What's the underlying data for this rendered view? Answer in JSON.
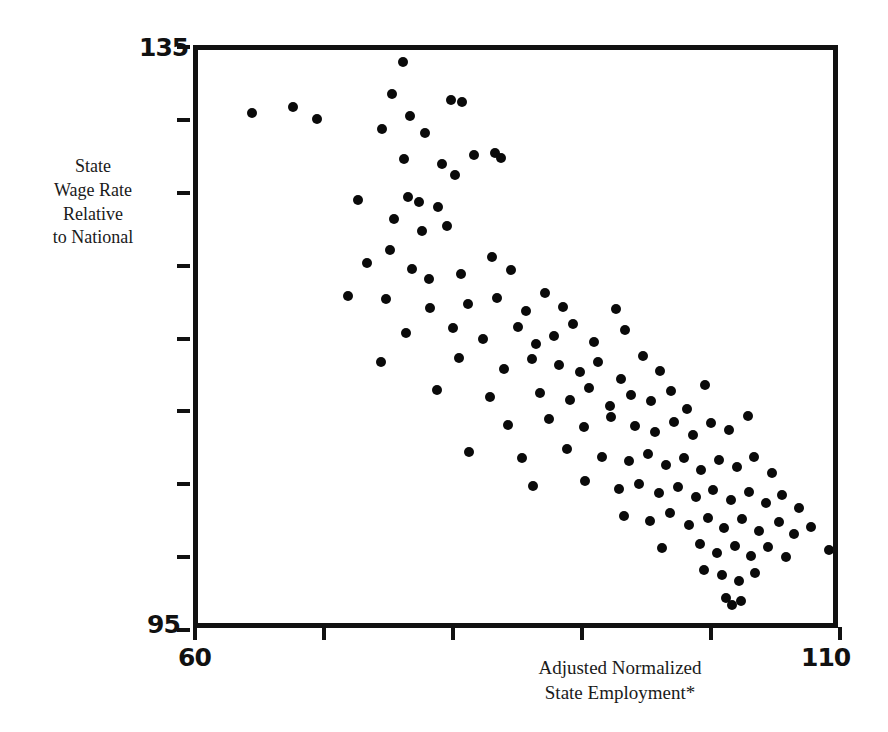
{
  "chart_data": {
    "type": "scatter",
    "title": "",
    "xlabel": "Adjusted Normalized State Employment*",
    "ylabel": "State Wage Rate Relative to National",
    "xlim": [
      60,
      110
    ],
    "ylim": [
      95,
      135
    ],
    "grid": false,
    "legend": null,
    "x_tick_labels": [
      "60",
      "110"
    ],
    "y_tick_labels": [
      "135",
      "95"
    ],
    "x_ticks_count": 6,
    "y_ticks_count": 9,
    "marker": "filled-circle",
    "marker_color": "#0a0a0a",
    "points": [
      [
        64.2,
        130.7
      ],
      [
        67.4,
        131.1
      ],
      [
        69.2,
        130.3
      ],
      [
        75.0,
        132.0
      ],
      [
        75.9,
        134.2
      ],
      [
        74.3,
        129.6
      ],
      [
        76.4,
        130.5
      ],
      [
        77.6,
        129.3
      ],
      [
        79.6,
        131.6
      ],
      [
        80.5,
        131.4
      ],
      [
        76.0,
        127.5
      ],
      [
        78.9,
        127.2
      ],
      [
        79.9,
        126.4
      ],
      [
        81.4,
        127.8
      ],
      [
        83.0,
        127.9
      ],
      [
        83.5,
        127.6
      ],
      [
        72.4,
        124.7
      ],
      [
        76.3,
        124.9
      ],
      [
        77.1,
        124.6
      ],
      [
        78.6,
        124.2
      ],
      [
        75.2,
        123.4
      ],
      [
        77.4,
        122.6
      ],
      [
        79.3,
        122.9
      ],
      [
        74.9,
        121.3
      ],
      [
        73.1,
        120.4
      ],
      [
        76.6,
        120.0
      ],
      [
        77.9,
        119.3
      ],
      [
        80.4,
        119.6
      ],
      [
        82.8,
        120.8
      ],
      [
        84.3,
        119.9
      ],
      [
        71.6,
        118.1
      ],
      [
        74.6,
        117.9
      ],
      [
        78.0,
        117.3
      ],
      [
        80.9,
        117.6
      ],
      [
        83.2,
        118.0
      ],
      [
        85.4,
        117.1
      ],
      [
        86.9,
        118.3
      ],
      [
        88.3,
        117.4
      ],
      [
        76.1,
        115.6
      ],
      [
        79.8,
        115.9
      ],
      [
        82.1,
        115.2
      ],
      [
        84.8,
        116.0
      ],
      [
        86.2,
        114.8
      ],
      [
        87.6,
        115.4
      ],
      [
        89.1,
        116.2
      ],
      [
        90.7,
        115.0
      ],
      [
        92.4,
        117.2
      ],
      [
        93.1,
        115.8
      ],
      [
        74.2,
        113.6
      ],
      [
        80.2,
        113.9
      ],
      [
        83.7,
        113.1
      ],
      [
        85.9,
        113.8
      ],
      [
        88.0,
        113.4
      ],
      [
        89.6,
        112.9
      ],
      [
        91.0,
        113.6
      ],
      [
        92.8,
        112.4
      ],
      [
        94.5,
        114.0
      ],
      [
        95.8,
        113.0
      ],
      [
        78.5,
        111.7
      ],
      [
        82.6,
        111.2
      ],
      [
        86.5,
        111.5
      ],
      [
        88.8,
        111.0
      ],
      [
        90.3,
        111.8
      ],
      [
        91.9,
        110.6
      ],
      [
        93.6,
        111.3
      ],
      [
        95.1,
        110.9
      ],
      [
        96.7,
        111.6
      ],
      [
        97.9,
        110.4
      ],
      [
        99.3,
        112.0
      ],
      [
        84.0,
        109.3
      ],
      [
        87.2,
        109.7
      ],
      [
        89.9,
        109.1
      ],
      [
        92.0,
        109.8
      ],
      [
        93.9,
        109.2
      ],
      [
        95.4,
        108.8
      ],
      [
        96.9,
        109.5
      ],
      [
        98.4,
        108.6
      ],
      [
        99.8,
        109.4
      ],
      [
        101.2,
        108.9
      ],
      [
        102.6,
        109.9
      ],
      [
        81.0,
        107.4
      ],
      [
        85.1,
        107.0
      ],
      [
        88.6,
        107.6
      ],
      [
        91.3,
        107.1
      ],
      [
        93.4,
        106.8
      ],
      [
        94.9,
        107.3
      ],
      [
        96.3,
        106.5
      ],
      [
        97.7,
        107.0
      ],
      [
        99.0,
        106.2
      ],
      [
        100.4,
        106.9
      ],
      [
        101.8,
        106.4
      ],
      [
        103.1,
        107.1
      ],
      [
        104.5,
        106.0
      ],
      [
        86.0,
        105.1
      ],
      [
        90.0,
        105.4
      ],
      [
        92.6,
        104.9
      ],
      [
        94.2,
        105.2
      ],
      [
        95.7,
        104.6
      ],
      [
        97.2,
        105.0
      ],
      [
        98.6,
        104.3
      ],
      [
        99.9,
        104.8
      ],
      [
        101.3,
        104.1
      ],
      [
        102.7,
        104.7
      ],
      [
        104.0,
        103.9
      ],
      [
        105.3,
        104.5
      ],
      [
        106.6,
        103.6
      ],
      [
        93.0,
        103.0
      ],
      [
        95.0,
        102.7
      ],
      [
        96.6,
        103.2
      ],
      [
        98.1,
        102.4
      ],
      [
        99.5,
        102.9
      ],
      [
        100.8,
        102.2
      ],
      [
        102.2,
        102.8
      ],
      [
        103.5,
        102.0
      ],
      [
        105.0,
        102.6
      ],
      [
        106.2,
        101.8
      ],
      [
        107.5,
        102.3
      ],
      [
        96.0,
        100.8
      ],
      [
        98.9,
        101.1
      ],
      [
        100.2,
        100.5
      ],
      [
        101.6,
        101.0
      ],
      [
        102.9,
        100.3
      ],
      [
        104.2,
        100.9
      ],
      [
        105.6,
        100.2
      ],
      [
        108.9,
        100.7
      ],
      [
        99.2,
        99.3
      ],
      [
        100.6,
        99.0
      ],
      [
        101.9,
        98.6
      ],
      [
        103.2,
        99.1
      ],
      [
        100.9,
        97.4
      ],
      [
        101.4,
        96.9
      ],
      [
        102.1,
        97.2
      ]
    ]
  },
  "axes": {
    "y_top_label": "135",
    "y_bottom_label": "95",
    "x_left_label": "60",
    "x_right_label": "110",
    "y_title_lines": [
      "State",
      "Wage Rate",
      "Relative",
      "to National"
    ],
    "x_title_lines": [
      "Adjusted Normalized",
      "State Employment*"
    ]
  }
}
